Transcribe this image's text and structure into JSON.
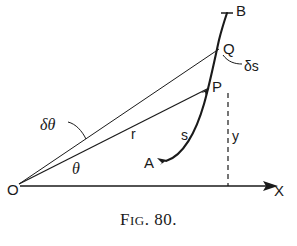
{
  "figure": {
    "caption_prefix": "F",
    "caption_smallcaps": "IG",
    "caption_number": ". 80.",
    "caption_full": "Fig. 80."
  },
  "points": {
    "B": "B",
    "Q": "Q",
    "P": "P",
    "A": "A",
    "O": "O"
  },
  "axes": {
    "x_label": "X"
  },
  "annotations": {
    "delta_s": "δs",
    "radius_r": "r",
    "arc_s": "s",
    "ordinate_y": "y",
    "delta_theta": "δθ",
    "theta": "θ"
  },
  "colors": {
    "ink": "#1a1a1a",
    "background": "#ffffff",
    "thin_line": "#222222"
  }
}
